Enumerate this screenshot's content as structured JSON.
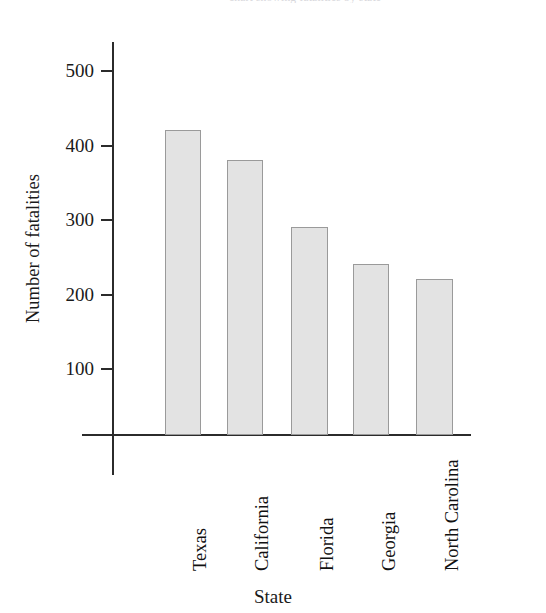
{
  "figure": {
    "clipped_top_text": "chart showing fatalities by state",
    "background_color": "#ffffff",
    "axis_color": "#2b2b2b"
  },
  "chart_data": {
    "type": "bar",
    "title": "",
    "xlabel": "State",
    "ylabel": "Number of fatalities",
    "categories": [
      "Texas",
      "California",
      "Florida",
      "Georgia",
      "North Carolina"
    ],
    "values": [
      455,
      410,
      310,
      255,
      233
    ],
    "ylim": [
      0,
      540
    ],
    "yticks": [
      100,
      200,
      300,
      400,
      500
    ],
    "ytick_labels": [
      "100",
      "200",
      "300",
      "400",
      "500"
    ],
    "grid": false,
    "legend": null,
    "bar_fill_color": "#e3e3e3",
    "bar_edge_color": "#9a9a9a",
    "series": [
      {
        "name": "Number of fatalities",
        "values": [
          455,
          410,
          310,
          255,
          233
        ]
      }
    ]
  }
}
